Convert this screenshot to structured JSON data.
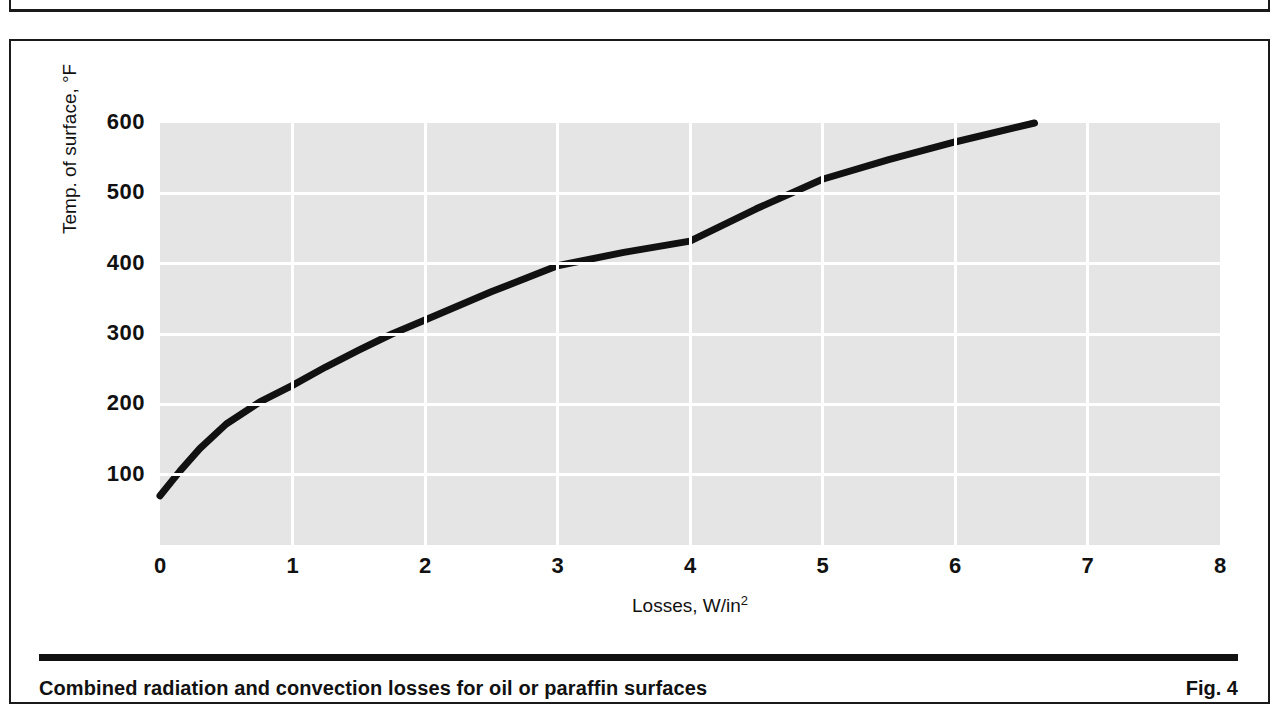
{
  "figure": {
    "caption": "Combined radiation and convection losses for oil or paraffin surfaces",
    "number": "Fig. 4"
  },
  "chart_data": {
    "type": "line",
    "title": "",
    "xlabel": "Losses, W/in",
    "xlabel_superscript": "2",
    "ylabel": "Temp. of surface, °F",
    "xlim": [
      0,
      8
    ],
    "ylim": [
      0,
      600
    ],
    "xticks": [
      "0",
      "1",
      "2",
      "3",
      "4",
      "5",
      "6",
      "7",
      "8"
    ],
    "xtick_values": [
      0,
      1,
      2,
      3,
      4,
      5,
      6,
      7,
      8
    ],
    "yticks": [
      "100",
      "200",
      "300",
      "400",
      "500",
      "600"
    ],
    "ytick_values": [
      100,
      200,
      300,
      400,
      500,
      600
    ],
    "grid": true,
    "grid_color": "#ffffff",
    "plot_background": "#e5e5e5",
    "line_color": "#111111",
    "legend": null,
    "series": [
      {
        "name": "Combined radiation and convection loss",
        "x": [
          0.0,
          0.15,
          0.3,
          0.5,
          0.75,
          1.0,
          1.25,
          1.5,
          1.75,
          2.0,
          2.5,
          3.0,
          3.5,
          4.0,
          4.5,
          5.0,
          5.5,
          6.0,
          6.6
        ],
        "y": [
          70,
          105,
          137,
          172,
          203,
          227,
          253,
          277,
          300,
          320,
          360,
          397,
          416,
          432,
          478,
          520,
          548,
          573,
          600
        ]
      }
    ]
  }
}
